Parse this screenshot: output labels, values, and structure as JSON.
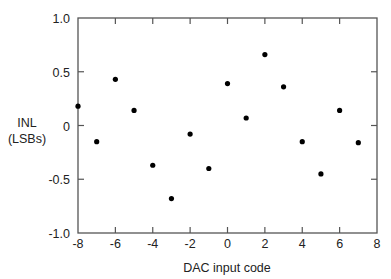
{
  "chart_data": {
    "type": "scatter",
    "title": "",
    "xlabel": "DAC input code",
    "ylabel_lines": [
      "INL",
      "(LSBs)"
    ],
    "ylabel": "INL (LSBs)",
    "xlim": [
      -8,
      8
    ],
    "ylim": [
      -1.0,
      1.0
    ],
    "grid": false,
    "legend": null,
    "x_ticks": [
      -8,
      -6,
      -4,
      -2,
      0,
      2,
      4,
      6,
      8
    ],
    "x_tick_labels": [
      "-8",
      "-6",
      "-4",
      "-2",
      "0",
      "2",
      "4",
      "6",
      "8"
    ],
    "y_ticks": [
      1.0,
      0.5,
      0,
      -0.5,
      -1.0
    ],
    "y_tick_labels": [
      "1.0",
      "0.5",
      "0",
      "-0.5",
      "-1.0"
    ],
    "series": [
      {
        "name": "INL",
        "marker": "filled-circle",
        "color": "#000000",
        "x": [
          -8,
          -7,
          -6,
          -5,
          -4,
          -3,
          -2,
          -1,
          0,
          1,
          2,
          3,
          4,
          5,
          6,
          7
        ],
        "y": [
          0.18,
          -0.15,
          0.43,
          0.14,
          -0.37,
          -0.68,
          -0.08,
          -0.4,
          0.39,
          0.07,
          0.66,
          0.36,
          -0.15,
          -0.45,
          0.14,
          -0.16
        ]
      }
    ]
  },
  "colors": {
    "axis": "#555555",
    "marker": "#000000",
    "text": "#222222",
    "background": "#ffffff"
  }
}
